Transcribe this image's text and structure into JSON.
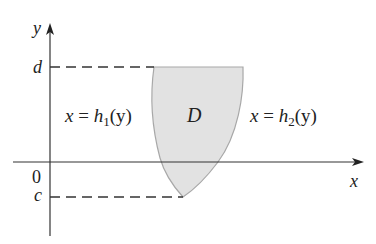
{
  "diagram": {
    "region_label": "D",
    "axis_x_label": "x",
    "axis_y_label": "y",
    "origin_label": "0",
    "tick_top_label": "d",
    "tick_bottom_label": "c",
    "left_curve": {
      "lhs": "x",
      "eq": "=",
      "func": "h",
      "sub": "1",
      "arg": "(y)"
    },
    "right_curve": {
      "lhs": "x",
      "eq": "=",
      "func": "h",
      "sub": "2",
      "arg": "(y)"
    },
    "colors": {
      "region_fill": "#e2e2e2",
      "region_edge": "#a8a8a8",
      "axes": "#333333",
      "text": "#222222"
    }
  }
}
